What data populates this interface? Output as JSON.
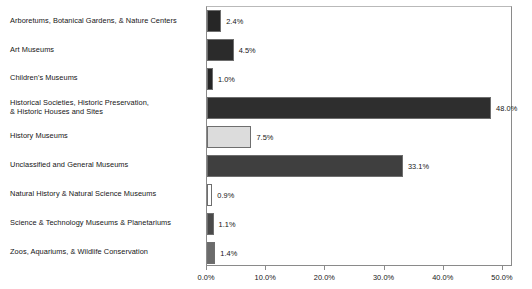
{
  "chart_data": {
    "type": "bar",
    "orientation": "horizontal",
    "title": "",
    "xlabel": "",
    "ylabel": "",
    "xlim": [
      0,
      51.7
    ],
    "grid": false,
    "legend": null,
    "tick_labels": [
      "0.0%",
      "10.0%",
      "20.0%",
      "30.0%",
      "40.0%",
      "50.0%"
    ],
    "tick_values": [
      0,
      10,
      20,
      30,
      40,
      50
    ],
    "categories": [
      "Arboretums, Botanical Gardens, & Nature Centers",
      "Art Museums",
      "Children's Museums",
      "Historical Societies, Historic Preservation, & Historic Houses and Sites",
      "History Museums",
      "Unclassified and General Museums",
      "Natural History & Natural Science Museums",
      "Science & Technology Museums & Planetariums",
      "Zoos, Aquariums, & Wildlife Conservation"
    ],
    "values": [
      2.4,
      4.5,
      1.0,
      48.0,
      7.5,
      33.1,
      0.9,
      1.1,
      1.4
    ],
    "value_labels": [
      "2.4%",
      "4.5%",
      "1.0%",
      "48.0%",
      "7.5%",
      "33.1%",
      "0.9%",
      "1.1%",
      "1.4%"
    ],
    "bar_colors": [
      "#262626",
      "#2b2b2b",
      "#262626",
      "#2e2e2e",
      "#dcdcdc",
      "#3f3f3f",
      "#ffffff",
      "#4a4a4a",
      "#6b6b6b"
    ],
    "bar_border_color": "#6e6e6e",
    "bars": [
      {
        "label_lines": [
          "Arboretums, Botanical Gardens, & Nature Centers"
        ],
        "value": 2.4,
        "value_label": "2.4%",
        "color": "#262626"
      },
      {
        "label_lines": [
          "Art Museums"
        ],
        "value": 4.5,
        "value_label": "4.5%",
        "color": "#2b2b2b"
      },
      {
        "label_lines": [
          "Children's Museums"
        ],
        "value": 1.0,
        "value_label": "1.0%",
        "color": "#262626"
      },
      {
        "label_lines": [
          "Historical Societies, Historic Preservation,",
          "& Historic Houses and Sites"
        ],
        "value": 48.0,
        "value_label": "48.0%",
        "color": "#2e2e2e"
      },
      {
        "label_lines": [
          "History Museums"
        ],
        "value": 7.5,
        "value_label": "7.5%",
        "color": "#dcdcdc"
      },
      {
        "label_lines": [
          "Unclassified and General Museums"
        ],
        "value": 33.1,
        "value_label": "33.1%",
        "color": "#3f3f3f"
      },
      {
        "label_lines": [
          "Natural History & Natural Science Museums"
        ],
        "value": 0.9,
        "value_label": "0.9%",
        "color": "#ffffff"
      },
      {
        "label_lines": [
          "Science & Technology Museums & Planetariums"
        ],
        "value": 1.1,
        "value_label": "1.1%",
        "color": "#4a4a4a"
      },
      {
        "label_lines": [
          "Zoos, Aquariums, & Wildlife Conservation"
        ],
        "value": 1.4,
        "value_label": "1.4%",
        "color": "#6b6b6b"
      }
    ]
  }
}
